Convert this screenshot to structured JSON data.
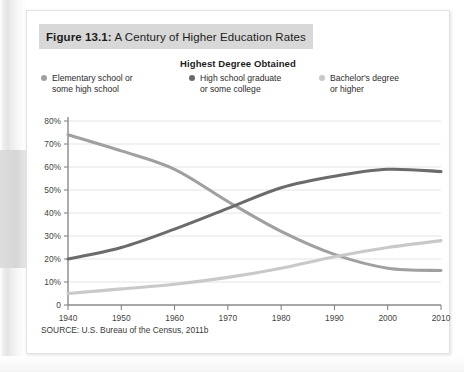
{
  "figure": {
    "number_label": "Figure 13.1:",
    "title": "A Century of Higher Education Rates",
    "source": "SOURCE: U.S. Bureau of the Census, 2011b"
  },
  "legend": {
    "title": "Highest Degree Obtained",
    "items": [
      {
        "label": "Elementary school or\nsome high school",
        "color": "#a0a0a0"
      },
      {
        "label": "High school graduate\nor some college",
        "color": "#6b6b6b"
      },
      {
        "label": "Bachelor's degree\nor higher",
        "color": "#c9c9c9"
      }
    ]
  },
  "chart_data": {
    "type": "line",
    "title": "A Century of Higher Education Rates",
    "xlabel": "",
    "ylabel": "",
    "x": [
      1940,
      1950,
      1960,
      1970,
      1980,
      1990,
      2000,
      2010
    ],
    "categories": [
      "1940",
      "1950",
      "1960",
      "1970",
      "1980",
      "1990",
      "2000",
      "2010"
    ],
    "xlim": [
      1940,
      2010
    ],
    "ylim": [
      0,
      80
    ],
    "ytick_labels": [
      "0",
      "10%",
      "20%",
      "30%",
      "40%",
      "50%",
      "60%",
      "70%",
      "80%"
    ],
    "ytick_values": [
      0,
      10,
      20,
      30,
      40,
      50,
      60,
      70,
      80
    ],
    "grid": true,
    "legend_position": "top",
    "series": [
      {
        "name": "Elementary school or some high school",
        "color": "#a0a0a0",
        "values": [
          74,
          67,
          59,
          45,
          32,
          22,
          16,
          15
        ]
      },
      {
        "name": "High school graduate or some college",
        "color": "#6b6b6b",
        "values": [
          20,
          25,
          33,
          42,
          51,
          56,
          59,
          58
        ]
      },
      {
        "name": "Bachelor's degree or higher",
        "color": "#c9c9c9",
        "values": [
          5,
          7,
          9,
          12,
          16,
          21,
          25,
          28
        ]
      }
    ]
  },
  "axis": {
    "tick_color": "#7a7a7a",
    "grid_color": "#e4e4e4",
    "label_color": "#444444"
  }
}
